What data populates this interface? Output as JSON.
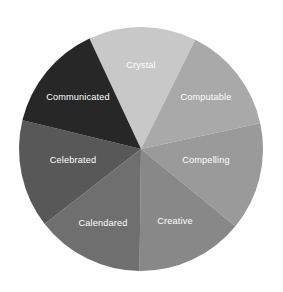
{
  "chart_data": {
    "type": "pie",
    "title": "",
    "subtitle": "",
    "xlabel": "",
    "ylabel": "",
    "grid": false,
    "legend": "none",
    "labels_inside_slices": true,
    "label_text_color": "#ffffff",
    "background_color": "#ffffff",
    "center": {
      "x": 141,
      "y": 149
    },
    "radius": 122,
    "start_angle_deg": -115,
    "direction": "clockwise",
    "categories": [
      "Crystal",
      "Computable",
      "Compelling",
      "Creative",
      "Calendared",
      "Celebrated",
      "Communicated"
    ],
    "values": [
      14.29,
      14.29,
      14.29,
      14.29,
      14.29,
      14.29,
      14.29
    ],
    "colors": [
      "#c8c8c8",
      "#a9a9a9",
      "#9a9a9a",
      "#888888",
      "#6f6f6f",
      "#585858",
      "#272727"
    ],
    "slices": [
      {
        "label": "Crystal",
        "value": 14.29,
        "color": "#c8c8c8",
        "start_deg": -115,
        "end_deg": -63.57,
        "label_x": 141,
        "label_y": 66
      },
      {
        "label": "Computable",
        "value": 14.29,
        "color": "#a9a9a9",
        "start_deg": -63.57,
        "end_deg": -12.14,
        "label_x": 206,
        "label_y": 98
      },
      {
        "label": "Compelling",
        "value": 14.29,
        "color": "#9a9a9a",
        "start_deg": -12.14,
        "end_deg": 39.29,
        "label_x": 206,
        "label_y": 161
      },
      {
        "label": "Creative",
        "value": 14.29,
        "color": "#888888",
        "start_deg": 39.29,
        "end_deg": 90.71,
        "label_x": 175,
        "label_y": 222
      },
      {
        "label": "Calendared",
        "value": 14.29,
        "color": "#6f6f6f",
        "start_deg": 90.71,
        "end_deg": 142.14,
        "label_x": 103,
        "label_y": 224
      },
      {
        "label": "Celebrated",
        "value": 14.29,
        "color": "#585858",
        "start_deg": 142.14,
        "end_deg": 193.57,
        "label_x": 73,
        "label_y": 161
      },
      {
        "label": "Communicated",
        "value": 14.29,
        "color": "#272727",
        "start_deg": 193.57,
        "end_deg": 245,
        "label_x": 78,
        "label_y": 98
      }
    ]
  }
}
